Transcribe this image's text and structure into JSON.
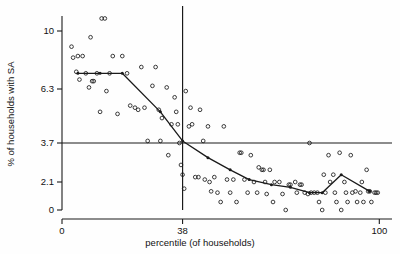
{
  "chart_data": {
    "type": "scatter",
    "title": "",
    "xlabel": "percentile (of households)",
    "ylabel": "% of households with SA",
    "xlim": [
      0,
      104
    ],
    "ylim": [
      0,
      11.6
    ],
    "grid": false,
    "legend": "none",
    "xticks": [
      {
        "value": 0,
        "label": "0"
      },
      {
        "value": 38,
        "label": "38"
      },
      {
        "value": 100,
        "label": "100"
      }
    ],
    "yticks": [
      {
        "value": 0,
        "label": "0"
      },
      {
        "value": 2.1,
        "label": "2.1"
      },
      {
        "value": 3.7,
        "label": "3.7"
      },
      {
        "value": 6.3,
        "label": "6.3"
      },
      {
        "value": 10,
        "label": "10"
      }
    ],
    "reference_lines": [
      {
        "name": "horizontal-threshold",
        "orientation": "horizontal",
        "value": 3.7
      },
      {
        "name": "vertical-threshold",
        "orientation": "vertical",
        "value": 38
      }
    ],
    "series": [
      {
        "name": "households",
        "marker": "open-circle",
        "points": [
          [
            3.0,
            9.0
          ],
          [
            3.5,
            8.3
          ],
          [
            4.5,
            7.4
          ],
          [
            5.0,
            8.4
          ],
          [
            5.5,
            6.9
          ],
          [
            6.5,
            8.4
          ],
          [
            7.5,
            7.3
          ],
          [
            8.5,
            6.4
          ],
          [
            9.0,
            9.6
          ],
          [
            9.5,
            6.8
          ],
          [
            10.0,
            6.8
          ],
          [
            11.0,
            7.3
          ],
          [
            12.0,
            5.2
          ],
          [
            12.5,
            10.8
          ],
          [
            13.5,
            10.8
          ],
          [
            14.0,
            6.2
          ],
          [
            15.0,
            7.3
          ],
          [
            16.0,
            8.4
          ],
          [
            17.5,
            5.1
          ],
          [
            19.0,
            8.4
          ],
          [
            20.5,
            7.3
          ],
          [
            21.5,
            5.5
          ],
          [
            23.0,
            5.4
          ],
          [
            24.0,
            5.3
          ],
          [
            25.0,
            7.7
          ],
          [
            26.0,
            5.4
          ],
          [
            27.0,
            3.8
          ],
          [
            28.5,
            6.5
          ],
          [
            29.5,
            7.7
          ],
          [
            30.5,
            5.3
          ],
          [
            31.0,
            3.8
          ],
          [
            31.5,
            4.9
          ],
          [
            33.0,
            6.4
          ],
          [
            33.5,
            3.2
          ],
          [
            34.5,
            4.6
          ],
          [
            35.5,
            5.9
          ],
          [
            36.0,
            5.2
          ],
          [
            36.5,
            4.6
          ],
          [
            37.0,
            3.7
          ],
          [
            37.5,
            2.8
          ],
          [
            38.0,
            2.4
          ],
          [
            38.5,
            1.6
          ],
          [
            39.0,
            6.2
          ],
          [
            40.0,
            4.5
          ],
          [
            40.5,
            5.4
          ],
          [
            41.0,
            4.6
          ],
          [
            42.0,
            2.3
          ],
          [
            43.0,
            2.3
          ],
          [
            43.5,
            5.3
          ],
          [
            44.5,
            3.8
          ],
          [
            45.0,
            2.2
          ],
          [
            46.0,
            4.5
          ],
          [
            46.5,
            2.1
          ],
          [
            47.0,
            1.4
          ],
          [
            48.0,
            2.3
          ],
          [
            49.0,
            1.3
          ],
          [
            50.0,
            0.6
          ],
          [
            51.0,
            4.5
          ],
          [
            52.0,
            2.2
          ],
          [
            53.0,
            1.3
          ],
          [
            54.0,
            2.2
          ],
          [
            55.0,
            0.6
          ],
          [
            56.0,
            3.3
          ],
          [
            56.5,
            3.3
          ],
          [
            57.5,
            2.2
          ],
          [
            58.5,
            1.3
          ],
          [
            59.5,
            3.2
          ],
          [
            60.5,
            2.1
          ],
          [
            61.5,
            1.3
          ],
          [
            62.0,
            2.7
          ],
          [
            63.0,
            2.6
          ],
          [
            63.5,
            2.6
          ],
          [
            64.0,
            2.1
          ],
          [
            64.5,
            1.2
          ],
          [
            65.5,
            2.6
          ],
          [
            66.5,
            0.6
          ],
          [
            67.0,
            2.1
          ],
          [
            68.5,
            2.1
          ],
          [
            69.5,
            1.2
          ],
          [
            70.5,
            0.0
          ],
          [
            71.5,
            1.9
          ],
          [
            72.0,
            1.9
          ],
          [
            73.5,
            2.1
          ],
          [
            74.0,
            1.3
          ],
          [
            75.0,
            1.9
          ],
          [
            75.5,
            1.9
          ],
          [
            76.5,
            1.3
          ],
          [
            77.5,
            1.2
          ],
          [
            78.0,
            3.7
          ],
          [
            78.5,
            1.3
          ],
          [
            79.5,
            1.3
          ],
          [
            80.5,
            1.3
          ],
          [
            81.0,
            0.6
          ],
          [
            82.0,
            0.0
          ],
          [
            82.5,
            2.4
          ],
          [
            83.0,
            1.3
          ],
          [
            84.0,
            3.2
          ],
          [
            84.5,
            2.1
          ],
          [
            85.5,
            2.4
          ],
          [
            86.0,
            1.3
          ],
          [
            86.5,
            0.6
          ],
          [
            87.5,
            3.3
          ],
          [
            88.0,
            0.0
          ],
          [
            89.0,
            2.1
          ],
          [
            89.5,
            1.3
          ],
          [
            90.0,
            0.6
          ],
          [
            91.0,
            3.2
          ],
          [
            91.5,
            1.3
          ],
          [
            92.5,
            1.4
          ],
          [
            93.0,
            0.6
          ],
          [
            94.0,
            1.3
          ],
          [
            94.5,
            2.1
          ],
          [
            95.0,
            0.6
          ],
          [
            96.0,
            2.6
          ],
          [
            96.5,
            1.4
          ],
          [
            97.0,
            1.4
          ],
          [
            97.5,
            0.6
          ],
          [
            98.5,
            1.3
          ],
          [
            99.0,
            1.3
          ],
          [
            99.5,
            1.3
          ]
        ]
      }
    ],
    "trend": {
      "name": "binned-median-trend",
      "vertices": [
        [
          5.0,
          7.3
        ],
        [
          12.0,
          7.3
        ],
        [
          19.0,
          7.3
        ],
        [
          31.0,
          5.2
        ],
        [
          38.0,
          3.8
        ],
        [
          46.0,
          3.1
        ],
        [
          53.0,
          2.6
        ],
        [
          59.0,
          2.2
        ],
        [
          66.0,
          1.9
        ],
        [
          72.0,
          1.7
        ],
        [
          78.0,
          1.3
        ],
        [
          82.0,
          1.3
        ],
        [
          88.0,
          2.4
        ],
        [
          97.0,
          1.4
        ]
      ]
    }
  }
}
